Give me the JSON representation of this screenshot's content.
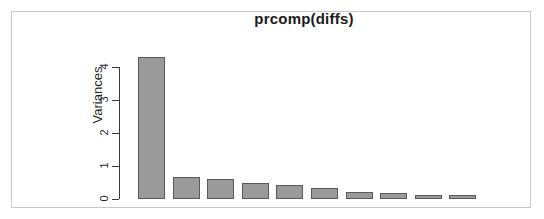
{
  "chart_data": {
    "type": "bar",
    "title": "prcomp(diffs)",
    "xlabel": "",
    "ylabel": "Variances",
    "categories": [
      "PC1",
      "PC2",
      "PC3",
      "PC4",
      "PC5",
      "PC6",
      "PC7",
      "PC8",
      "PC9",
      "PC10"
    ],
    "values": [
      4.3,
      0.68,
      0.6,
      0.5,
      0.42,
      0.33,
      0.2,
      0.17,
      0.13,
      0.13
    ],
    "ylim": [
      0,
      4.4
    ],
    "yticks": [
      0,
      1,
      2,
      3,
      4
    ],
    "ytick_labels": [
      "0",
      "1",
      "2",
      "3",
      "4"
    ],
    "grid": false,
    "legend": null,
    "bar_fill_color": "#9a9a9a",
    "bar_border_color": "#5a5a5a",
    "axis_color": "#3a3a3a",
    "frame_color": "#c9c9c9",
    "background_color": "#ffffff"
  }
}
